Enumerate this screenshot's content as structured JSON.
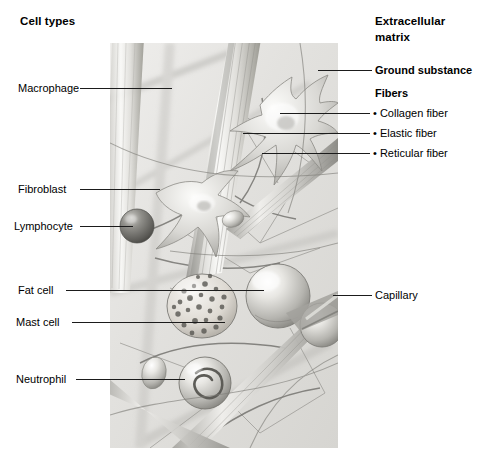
{
  "figure": {
    "panel": {
      "x": 110,
      "y": 43,
      "width": 228,
      "height": 405
    }
  },
  "left_column": {
    "heading": "Cell types",
    "items": [
      {
        "label": "Macrophage",
        "label_x": 18,
        "label_y": 88,
        "line_from": 80,
        "line_to": 172,
        "line_y": 88
      },
      {
        "label": "Fibroblast",
        "label_x": 18,
        "label_y": 189,
        "line_from": 80,
        "line_to": 160,
        "line_y": 189
      },
      {
        "label": "Lymphocyte",
        "label_x": 14,
        "label_y": 226,
        "line_from": 80,
        "line_to": 133,
        "line_y": 226
      },
      {
        "label": "Fat cell",
        "label_x": 18,
        "label_y": 290,
        "line_from": 66,
        "line_to": 264,
        "line_y": 290
      },
      {
        "label": "Mast cell",
        "label_x": 16,
        "label_y": 322,
        "line_from": 72,
        "line_to": 225,
        "line_y": 322
      },
      {
        "label": "Neutrophil",
        "label_x": 16,
        "label_y": 379,
        "line_from": 76,
        "line_to": 185,
        "line_y": 379
      }
    ]
  },
  "right_column": {
    "heading_line1": "Extracellular",
    "heading_line2": "matrix",
    "ground_substance": {
      "label": "Ground substance",
      "label_x": 375,
      "label_y": 70,
      "line_from": 318,
      "line_to": 372,
      "line_y": 70
    },
    "fibers_heading": "Fibers",
    "fibers": [
      {
        "bullet": "•",
        "label": "Collagen fiber",
        "label_x": 375,
        "label_y": 113,
        "line_from": 280,
        "line_to": 370,
        "line_y": 113
      },
      {
        "bullet": "•",
        "label": "Elastic fiber",
        "label_x": 375,
        "label_y": 133,
        "line_from": 243,
        "line_to": 370,
        "line_y": 133
      },
      {
        "bullet": "•",
        "label": "Reticular fiber",
        "label_x": 375,
        "label_y": 153,
        "line_from": 262,
        "line_to": 370,
        "line_y": 153
      }
    ],
    "capillary": {
      "label": "Capillary",
      "label_x": 375,
      "label_y": 295,
      "line_from": 333,
      "line_to": 372,
      "line_y": 295
    }
  },
  "colors": {
    "text": "#000000",
    "leader_line": "#1b1b1b",
    "panel_background": "#e9e9e7",
    "fiber_light": "#f2f1ef",
    "fiber_mid": "#b9b8b4",
    "fiber_dark": "#76757172",
    "cell_highlight": "#fbfbfa",
    "cell_shadow": "#8d8c88"
  }
}
